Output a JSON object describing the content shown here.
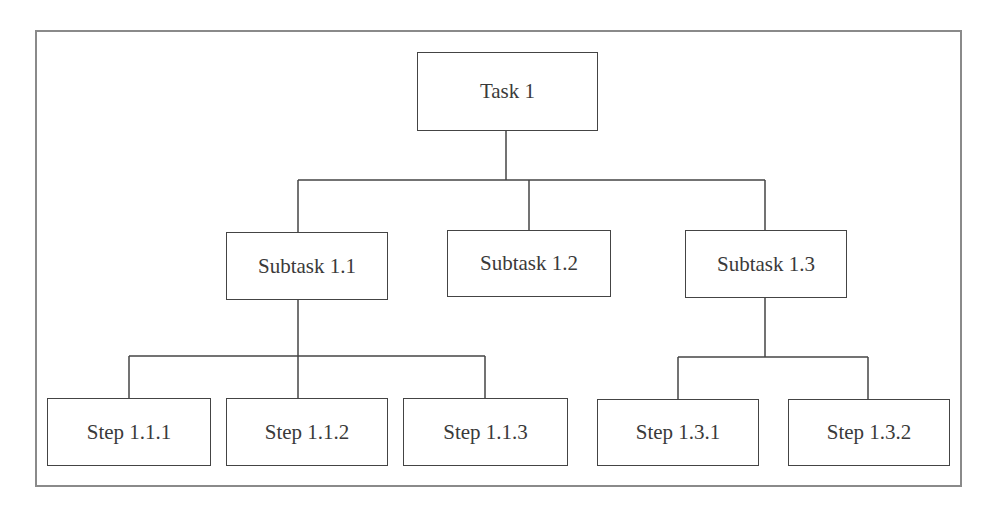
{
  "diagram": {
    "type": "hierarchy",
    "root": {
      "label": "Task 1",
      "children": [
        {
          "label": "Subtask 1.1",
          "children": [
            {
              "label": "Step 1.1.1"
            },
            {
              "label": "Step 1.1.2"
            },
            {
              "label": "Step 1.1.3"
            }
          ]
        },
        {
          "label": "Subtask 1.2"
        },
        {
          "label": "Subtask 1.3",
          "children": [
            {
              "label": "Step 1.3.1"
            },
            {
              "label": "Step 1.3.2"
            }
          ]
        }
      ]
    }
  },
  "nodes": {
    "task1": "Task 1",
    "subtask11": "Subtask 1.1",
    "subtask12": "Subtask 1.2",
    "subtask13": "Subtask 1.3",
    "step111": "Step 1.1.1",
    "step112": "Step 1.1.2",
    "step113": "Step 1.1.3",
    "step131": "Step 1.3.1",
    "step132": "Step 1.3.2"
  },
  "colors": {
    "line": "#444444",
    "frame": "#8a8a8a",
    "text": "#3a3a3a",
    "background": "#ffffff"
  }
}
